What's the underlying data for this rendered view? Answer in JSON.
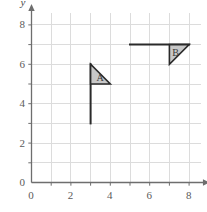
{
  "chart_data": {
    "type": "scatter",
    "title": "",
    "xlabel": "x",
    "ylabel": "y",
    "xlim": [
      0,
      8.6
    ],
    "ylim": [
      0,
      8.6
    ],
    "grid": true,
    "grid_spacing": 1,
    "legend": "none",
    "x_ticks": [
      0,
      1,
      2,
      3,
      4,
      5,
      6,
      7,
      8
    ],
    "y_ticks": [
      0,
      1,
      2,
      3,
      4,
      5,
      6,
      7,
      8
    ],
    "x_tick_labels": [
      "0",
      "",
      "2",
      "",
      "4",
      "",
      "6",
      "",
      "8"
    ],
    "y_tick_labels": [
      "0",
      "",
      "2",
      "",
      "4",
      "",
      "6",
      "",
      "8"
    ],
    "annotations": [
      {
        "label": "A",
        "shape": "flag",
        "pole": {
          "from": [
            3,
            3
          ],
          "to": [
            3,
            6
          ]
        },
        "triangle": [
          [
            3,
            6
          ],
          [
            3,
            5
          ],
          [
            4,
            5
          ]
        ],
        "label_at": [
          3.3,
          5.3
        ]
      },
      {
        "label": "B",
        "shape": "flag",
        "pole": {
          "from": [
            5,
            7
          ],
          "to": [
            8,
            7
          ]
        },
        "triangle": [
          [
            7,
            7
          ],
          [
            8,
            7
          ],
          [
            7,
            6
          ]
        ],
        "label_at": [
          7.15,
          6.55
        ]
      }
    ],
    "colors": {
      "grid": "#dcdcdc",
      "axis": "#6e6e6e",
      "shape_fill": "#c8c8c8",
      "shape_stroke": "#2a2a2a",
      "tick_text": "#5b5b5b"
    }
  },
  "axes": {
    "x_name": "x",
    "y_name": "y"
  },
  "ticks": {
    "x": [
      "0",
      "2",
      "4",
      "6",
      "8"
    ],
    "y": [
      "0",
      "2",
      "4",
      "6",
      "8"
    ]
  },
  "shapes": {
    "a_label": "A",
    "b_label": "B"
  }
}
